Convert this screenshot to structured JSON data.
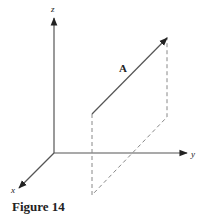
{
  "figure": {
    "caption": "Figure 14",
    "axes": {
      "x_label": "x",
      "y_label": "y",
      "z_label": "z"
    },
    "vector": {
      "label": "A"
    },
    "colors": {
      "axis": "#555555",
      "vector": "#555555",
      "dashed": "#888888",
      "text": "#222222"
    }
  }
}
